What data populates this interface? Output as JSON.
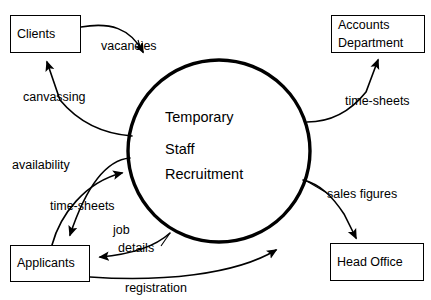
{
  "diagram": {
    "type": "data-flow-diagram",
    "title": "Temporary Staff Recruitment",
    "background_color": "#ffffff",
    "line_color": "#000000",
    "process": {
      "name": "Temporary Staff Recruitment",
      "line1": "Temporary",
      "line2": "Staff",
      "line3": "Recruitment",
      "shape": "circle",
      "cx": 219,
      "cy": 151,
      "r": 91
    },
    "entities": [
      {
        "id": "clients",
        "line1": "Clients",
        "line2": "",
        "x": 10,
        "y": 15,
        "w": 71,
        "h": 38
      },
      {
        "id": "accounts-department",
        "line1": "Accounts",
        "line2": "Department",
        "x": 331,
        "y": 15,
        "w": 94,
        "h": 38
      },
      {
        "id": "applicants",
        "line1": "Applicants",
        "line2": "",
        "x": 10,
        "y": 245,
        "w": 80,
        "h": 37
      },
      {
        "id": "head-office",
        "line1": "Head Office",
        "line2": "",
        "x": 330,
        "y": 243,
        "w": 94,
        "h": 38
      }
    ],
    "flows": [
      {
        "id": "vacancies",
        "label": "vacancies",
        "from": "clients",
        "to": "process",
        "x": 101,
        "y": 38
      },
      {
        "id": "canvassing",
        "label": "canvassing",
        "from": "process",
        "to": "clients",
        "x": 23,
        "y": 89
      },
      {
        "id": "time-sheets-out",
        "label": "time-sheets",
        "from": "process",
        "to": "accounts-department",
        "x": 345,
        "y": 93
      },
      {
        "id": "availability",
        "label": "availability",
        "from": "process",
        "to": "applicants",
        "x": 12,
        "y": 157
      },
      {
        "id": "time-sheets-in",
        "label": "time-sheets",
        "from": "applicants",
        "to": "process",
        "x": 50,
        "y": 198
      },
      {
        "id": "sales-figures",
        "label": "sales figures",
        "from": "process",
        "to": "head-office",
        "x": 327,
        "y": 186
      },
      {
        "id": "job",
        "label": "job",
        "from": "process",
        "to": "applicants",
        "x": 113,
        "y": 222
      },
      {
        "id": "details",
        "label": "details",
        "from": "process",
        "to": "applicants",
        "x": 118,
        "y": 240
      },
      {
        "id": "registration",
        "label": "registration",
        "from": "applicants",
        "to": "process",
        "x": 125,
        "y": 280
      }
    ]
  }
}
